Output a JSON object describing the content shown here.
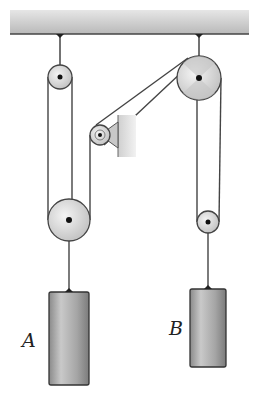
{
  "diagram": {
    "type": "pulley-system",
    "colors": {
      "ceiling": "#c4c4c4",
      "rope": "#444444",
      "pulley_fill": "#dcdcdc",
      "pulley_stroke": "#555555",
      "block_fill": "#a8a8a8",
      "bracket": "#bdbdbd"
    },
    "labels": {
      "block_a": "A",
      "block_b": "B"
    },
    "pulleys": [
      {
        "id": "top-left",
        "cx": 60,
        "cy": 77,
        "r": 12
      },
      {
        "id": "top-right",
        "cx": 199,
        "cy": 78,
        "r": 22
      },
      {
        "id": "bracket-small",
        "cx": 100,
        "cy": 135,
        "r": 10
      },
      {
        "id": "lower-left",
        "cx": 69,
        "cy": 220,
        "r": 21
      },
      {
        "id": "lower-right",
        "cx": 208,
        "cy": 222,
        "r": 11
      }
    ],
    "blocks": [
      {
        "id": "A",
        "x": 49,
        "y": 292,
        "w": 40,
        "h": 93
      },
      {
        "id": "B",
        "x": 190,
        "y": 289,
        "w": 36,
        "h": 78
      }
    ]
  }
}
